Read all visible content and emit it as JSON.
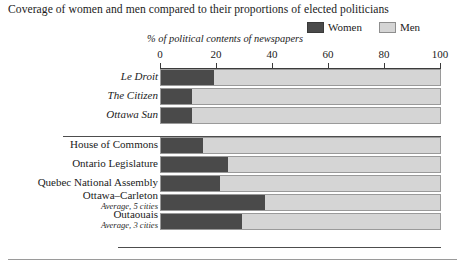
{
  "chart_data": {
    "type": "bar",
    "orientation": "horizontal",
    "stacked": true,
    "title": "Coverage of women and men compared to their proportions of elected politicians",
    "subtitle": "% of political contents of newspapers",
    "xlabel": "",
    "ylabel": "",
    "xlim": [
      0,
      100
    ],
    "xticks": [
      0,
      20,
      40,
      60,
      80,
      100
    ],
    "xtick_labels": [
      "0",
      "20",
      "40",
      "60",
      "80",
      "100"
    ],
    "grid": false,
    "legend_position": "top-right",
    "legend": [
      {
        "name": "Women",
        "color": "#4a4a4a"
      },
      {
        "name": "Men",
        "color": "#d5d5d5"
      }
    ],
    "series": [
      {
        "name": "Women",
        "values": [
          19,
          11,
          11,
          15,
          24,
          21,
          37,
          29
        ]
      },
      {
        "name": "Men",
        "values": [
          81,
          89,
          89,
          85,
          76,
          79,
          63,
          71
        ]
      }
    ],
    "categories": [
      "Le Droit",
      "The Citizen",
      "Ottawa Sun",
      "House of Commons",
      "Ontario Legislature",
      "Quebec National Assembly",
      "Ottawa–Carleton",
      "Outaouais"
    ],
    "groups": [
      {
        "name": "Newspapers",
        "categories": [
          "Le Droit",
          "The Citizen",
          "Ottawa Sun"
        ]
      },
      {
        "name": "Elected bodies",
        "categories": [
          "House of Commons",
          "Ontario Legislature",
          "Quebec National Assembly",
          "Ottawa–Carleton",
          "Outaouais"
        ]
      }
    ]
  },
  "title": "Coverage of women and men compared to their proportions of elected politicians",
  "axis_caption": "% of political contents of newspapers",
  "legend": {
    "women_label": "Women",
    "men_label": "Men"
  },
  "ticks": [
    {
      "label": "0",
      "value": 0
    },
    {
      "label": "20",
      "value": 20
    },
    {
      "label": "40",
      "value": 40
    },
    {
      "label": "60",
      "value": 60
    },
    {
      "label": "80",
      "value": 80
    },
    {
      "label": "100",
      "value": 100
    }
  ],
  "rows": [
    {
      "label": "Le Droit",
      "sub": "",
      "women": 19,
      "men": 81,
      "italic": true
    },
    {
      "label": "The Citizen",
      "sub": "",
      "women": 11,
      "men": 89,
      "italic": true
    },
    {
      "label": "Ottawa Sun",
      "sub": "",
      "women": 11,
      "men": 89,
      "italic": true
    },
    {
      "label": "House of Commons",
      "sub": "",
      "women": 15,
      "men": 85,
      "italic": false
    },
    {
      "label": "Ontario Legislature",
      "sub": "",
      "women": 24,
      "men": 76,
      "italic": false
    },
    {
      "label": "Quebec National Assembly",
      "sub": "",
      "women": 21,
      "men": 79,
      "italic": false
    },
    {
      "label": "Ottawa–Carleton",
      "sub": "Average, 5 cities",
      "women": 37,
      "men": 63,
      "italic": false
    },
    {
      "label": "Outaouais",
      "sub": "Average, 3 cities",
      "women": 29,
      "men": 71,
      "italic": false
    }
  ],
  "colors": {
    "women": "#4a4a4a",
    "men": "#d5d5d5",
    "rule": "#4d4d4d",
    "text": "#1b1b1b"
  }
}
